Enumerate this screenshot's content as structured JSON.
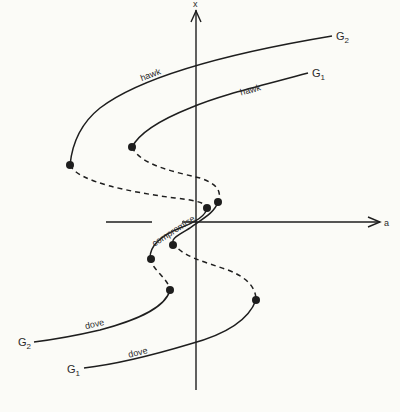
{
  "diagram": {
    "type": "bifurcation-curves",
    "axes": {
      "x_axis_label": "a",
      "y_axis_label": "x"
    },
    "curves": [
      {
        "name": "G2",
        "label_main": "G",
        "label_sub": "2"
      },
      {
        "name": "G1",
        "label_main": "G",
        "label_sub": "1"
      }
    ],
    "branch_labels": {
      "hawk_upper_g2": "hawk",
      "hawk_upper_g1": "hawk",
      "compromise": "compromise",
      "dove_lower_g2": "dove",
      "dove_lower_g1": "dove"
    },
    "curve_labels": {
      "g2_top": {
        "main": "G",
        "sub": "2"
      },
      "g1_top": {
        "main": "G",
        "sub": "1"
      },
      "g2_bottom": {
        "main": "G",
        "sub": "2"
      },
      "g1_bottom": {
        "main": "G",
        "sub": "1"
      }
    },
    "colors": {
      "ink": "#1e1e1e",
      "background": "#fbfbf7"
    }
  }
}
